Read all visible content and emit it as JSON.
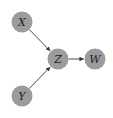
{
  "diagram": {
    "type": "directed-graph",
    "colors": {
      "node_fill": "#9c9c9c",
      "edge": "#333333",
      "label": "#222222"
    },
    "nodes": [
      {
        "id": "X",
        "label": "X",
        "cx": 22,
        "cy": 22
      },
      {
        "id": "Y",
        "label": "Y",
        "cx": 22,
        "cy": 96
      },
      {
        "id": "Z",
        "label": "Z",
        "cx": 58,
        "cy": 59
      },
      {
        "id": "W",
        "label": "W",
        "cx": 95,
        "cy": 59
      }
    ],
    "edges": [
      {
        "from": "X",
        "to": "Z"
      },
      {
        "from": "Y",
        "to": "Z"
      },
      {
        "from": "Z",
        "to": "W"
      }
    ]
  }
}
